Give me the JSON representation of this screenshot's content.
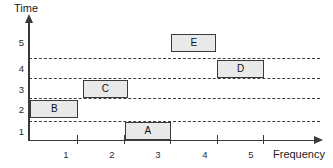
{
  "chart_data": {
    "type": "bar",
    "orientation": "horizontal",
    "title": "",
    "xlabel": "Frequency",
    "ylabel": "Time",
    "xticklabels": [
      "1",
      "2",
      "3",
      "4",
      "5"
    ],
    "yticklabels": [
      "1",
      "2",
      "3",
      "4",
      "5"
    ],
    "xlim": [
      0.5,
      6.0
    ],
    "ylim": [
      0.5,
      5.5
    ],
    "grid": true,
    "gridlines_y": [
      1.5,
      2.5,
      3.5,
      4.5
    ],
    "legend": "none",
    "bars": [
      {
        "label": "A",
        "time": 1,
        "frequency": 3,
        "freq_start": 2.55,
        "freq_end": 3.55
      },
      {
        "label": "B",
        "time": 2,
        "frequency": 1,
        "freq_start": 0.52,
        "freq_end": 1.55
      },
      {
        "label": "C",
        "time": 3,
        "frequency": 2,
        "freq_start": 1.65,
        "freq_end": 2.62
      },
      {
        "label": "D",
        "time": 4,
        "frequency": 5,
        "freq_start": 4.55,
        "freq_end": 5.55
      },
      {
        "label": "E",
        "time": 5,
        "frequency": 4,
        "freq_start": 3.55,
        "freq_end": 4.53
      }
    ]
  },
  "axes": {
    "y_title": "Time",
    "x_title": "Frequency"
  },
  "colors": {
    "bar_fill": "#e9e9e9",
    "bar_stroke": "#3a3a3a",
    "axis": "#3a3a3a",
    "grid": "#3d3d3d",
    "text": "#1a1a1a",
    "background": "#ffffff"
  }
}
